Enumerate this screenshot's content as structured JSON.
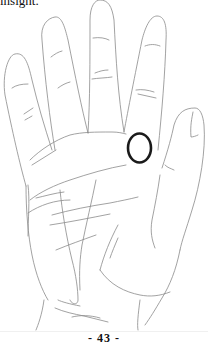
{
  "document": {
    "top_text": "insight.",
    "page_number": "- 43 -"
  },
  "figure": {
    "marker": {
      "shape": "circle",
      "location": "below base of ring finger / mount area",
      "color": "#1a1a1a"
    },
    "line_color": "#8a8a8a"
  }
}
